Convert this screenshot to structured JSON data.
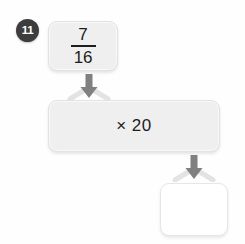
{
  "worksheet": {
    "problem_number": "11",
    "badge_color": "#3d3d3d",
    "background_color": "#fefefe"
  },
  "flow": {
    "input": {
      "type": "fraction",
      "numerator": "7",
      "denominator": "16",
      "box_fill": "#efefef"
    },
    "operation": {
      "label": "× 20",
      "operator": "×",
      "operand": "20",
      "box_fill": "#efefef"
    },
    "output": {
      "value": "",
      "placeholder": "",
      "box_fill": "#ffffff"
    },
    "arrows": [
      {
        "name": "arrow-input-to-operation",
        "direction": "down",
        "color": "#7e7e7e"
      },
      {
        "name": "arrow-operation-to-output",
        "direction": "down",
        "color": "#7e7e7e"
      }
    ]
  }
}
